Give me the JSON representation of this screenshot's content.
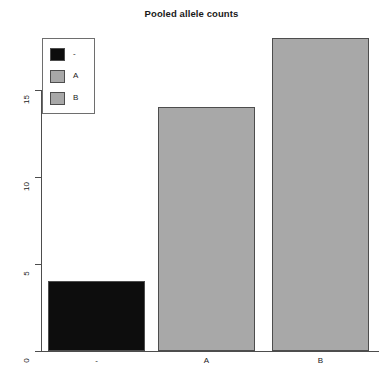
{
  "chart_data": {
    "type": "bar",
    "title": "Pooled allele counts",
    "xlabel": "",
    "ylabel": "",
    "categories": [
      "-",
      "A",
      "B"
    ],
    "values": [
      4,
      14,
      18
    ],
    "series": [
      {
        "name": "Pooled allele counts",
        "values": [
          4,
          14,
          18
        ]
      }
    ],
    "colors": [
      "#0d0d0d",
      "#a8a8a8",
      "#a8a8a8"
    ],
    "bar_border_color": "#4d4d4d",
    "ylim": [
      0,
      18.8
    ],
    "yticks": [
      0,
      5,
      10,
      15
    ],
    "ytick_labels": [
      "0",
      "5",
      "10",
      "15"
    ],
    "xtick_labels": [
      "-",
      "A",
      "B"
    ],
    "grid": false,
    "legend": {
      "position": "top-left",
      "entries": [
        {
          "label": "-",
          "color": "#0d0d0d"
        },
        {
          "label": "A",
          "color": "#a8a8a8"
        },
        {
          "label": "B",
          "color": "#a8a8a8"
        }
      ]
    },
    "axis_color": "#4d4d4d",
    "background": "#ffffff"
  }
}
